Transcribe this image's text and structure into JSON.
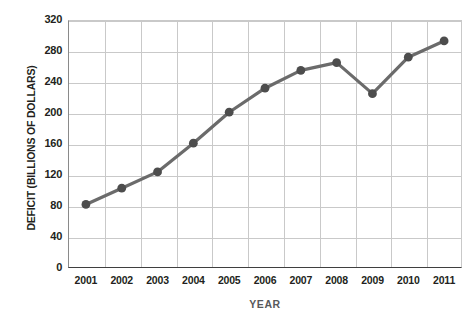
{
  "chart_data": {
    "type": "line",
    "title": "",
    "xlabel": "YEAR",
    "ylabel": "DEFICIT (BILLIONS OF DOLLARS)",
    "categories": [
      "2001",
      "2002",
      "2003",
      "2004",
      "2005",
      "2006",
      "2007",
      "2008",
      "2009",
      "2010",
      "2011"
    ],
    "x": [
      2001,
      2002,
      2003,
      2004,
      2005,
      2006,
      2007,
      2008,
      2009,
      2010,
      2011
    ],
    "series": [
      {
        "name": "Deficit",
        "values": [
          82,
          103,
          124,
          161,
          201,
          232,
          255,
          265,
          225,
          272,
          293
        ]
      }
    ],
    "ylim": [
      0,
      320
    ],
    "yticks": [
      0,
      40,
      80,
      120,
      160,
      200,
      240,
      280,
      320
    ],
    "ytick_labels": [
      "0",
      "40",
      "80",
      "120",
      "160",
      "200",
      "240",
      "280",
      "320"
    ],
    "xtick_labels": [
      "2001",
      "2002",
      "2003",
      "2004",
      "2005",
      "2006",
      "2007",
      "2008",
      "2009",
      "2010",
      "2011"
    ],
    "grid": true,
    "legend": false,
    "legend_position": "none",
    "colors": {
      "line": "#6b6b6b",
      "marker": "#4d4d4d",
      "grid": "#c9c9c9",
      "axis": "#3f3f3f",
      "text": "#231f20",
      "axis_title": "#58595b",
      "background": "#ffffff"
    }
  }
}
